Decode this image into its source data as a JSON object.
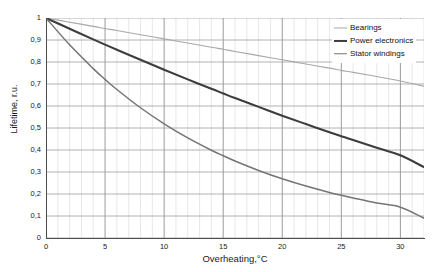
{
  "chart_data": {
    "type": "line",
    "title": "",
    "xlabel": "Overheating,°C",
    "ylabel": "Lifetime, r.u.",
    "xlim": [
      0,
      32
    ],
    "ylim": [
      0,
      1
    ],
    "grid": true,
    "legend_position": "top-right",
    "x_major_step": 5,
    "x_minor_step": 1,
    "y_step": 0.1,
    "x_tick_labels": [
      "0",
      "5",
      "10",
      "15",
      "20",
      "25",
      "30"
    ],
    "x_tick_values": [
      0,
      5,
      10,
      15,
      20,
      25,
      30
    ],
    "y_tick_labels": [
      "0",
      "0,1",
      "0,2",
      "0,3",
      "0,4",
      "0,5",
      "0,6",
      "0,7",
      "0,8",
      "0,9",
      "1"
    ],
    "y_tick_values": [
      0,
      0.1,
      0.2,
      0.3,
      0.4,
      0.5,
      0.6,
      0.7,
      0.8,
      0.9,
      1
    ],
    "x": [
      0,
      2,
      4,
      5,
      6,
      8,
      10,
      12,
      14,
      15,
      16,
      18,
      20,
      22,
      24,
      25,
      26,
      28,
      30,
      32
    ],
    "series": [
      {
        "name": "Bearings",
        "color": "#a8a8a8",
        "width": 1.1,
        "values": [
          1,
          0.981,
          0.962,
          0.952,
          0.943,
          0.924,
          0.905,
          0.886,
          0.867,
          0.858,
          0.848,
          0.829,
          0.81,
          0.791,
          0.772,
          0.762,
          0.753,
          0.734,
          0.714,
          0.69
        ]
      },
      {
        "name": "Power electronics",
        "color": "#3d3d3d",
        "width": 2.1,
        "values": [
          1,
          0.951,
          0.903,
          0.879,
          0.856,
          0.81,
          0.765,
          0.721,
          0.678,
          0.657,
          0.636,
          0.596,
          0.556,
          0.518,
          0.481,
          0.463,
          0.445,
          0.41,
          0.376,
          0.322
        ]
      },
      {
        "name": "Stator windings",
        "color": "#747474",
        "width": 1.5,
        "values": [
          1,
          0.878,
          0.77,
          0.721,
          0.675,
          0.592,
          0.519,
          0.455,
          0.399,
          0.374,
          0.35,
          0.307,
          0.269,
          0.236,
          0.207,
          0.194,
          0.182,
          0.159,
          0.14,
          0.09
        ]
      }
    ]
  },
  "legend": {
    "items": [
      {
        "label": "Bearings"
      },
      {
        "label": "Power electronics"
      },
      {
        "label": "Stator windings"
      }
    ]
  }
}
